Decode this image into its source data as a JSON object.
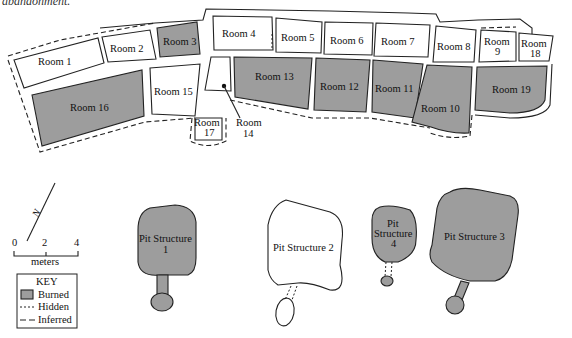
{
  "caption": "abandonment.",
  "colors": {
    "burned_fill": "#9d9d9d",
    "unburned_fill": "#ffffff",
    "line": "#222222"
  },
  "rooms": [
    {
      "id": "room-1",
      "label": "Room 1",
      "burned": false
    },
    {
      "id": "room-2",
      "label": "Room 2",
      "burned": false
    },
    {
      "id": "room-3",
      "label": "Room 3",
      "burned": true
    },
    {
      "id": "room-4",
      "label": "Room 4",
      "burned": false
    },
    {
      "id": "room-5",
      "label": "Room 5",
      "burned": false
    },
    {
      "id": "room-6",
      "label": "Room 6",
      "burned": false
    },
    {
      "id": "room-7",
      "label": "Room 7",
      "burned": false
    },
    {
      "id": "room-8",
      "label": "Room 8",
      "burned": false
    },
    {
      "id": "room-9",
      "label": "Room",
      "label2": "9",
      "burned": false
    },
    {
      "id": "room-18",
      "label": "Room",
      "label2": "18",
      "burned": false
    },
    {
      "id": "room-16",
      "label": "Room 16",
      "burned": true
    },
    {
      "id": "room-15",
      "label": "Room 15",
      "burned": false
    },
    {
      "id": "room-17",
      "label": "Room",
      "label2": "17",
      "burned": false
    },
    {
      "id": "room-14",
      "label": "Room",
      "label2": "14",
      "burned": false
    },
    {
      "id": "room-13",
      "label": "Room 13",
      "burned": true
    },
    {
      "id": "room-12",
      "label": "Room 12",
      "burned": true
    },
    {
      "id": "room-11",
      "label": "Room 11",
      "burned": true
    },
    {
      "id": "room-10",
      "label": "Room 10",
      "burned": true
    },
    {
      "id": "room-19",
      "label": "Room 19",
      "burned": true
    }
  ],
  "pit_structures": [
    {
      "id": "pit-1",
      "label": "Pit Structure",
      "label2": "1",
      "burned": true
    },
    {
      "id": "pit-2",
      "label": "Pit Structure 2",
      "burned": false
    },
    {
      "id": "pit-4",
      "label": "Pit",
      "label2": "Structure",
      "label3": "4",
      "burned": true
    },
    {
      "id": "pit-3",
      "label": "Pit Structure 3",
      "burned": true
    }
  ],
  "north_arrow": {
    "label": "N"
  },
  "scale": {
    "ticks": [
      "0",
      "2",
      "4"
    ],
    "unit": "meters"
  },
  "key": {
    "title": "KEY",
    "items": [
      {
        "symbol": "swatch",
        "label": "Burned"
      },
      {
        "symbol": "- - -",
        "label": "Hidden"
      },
      {
        "symbol": "— —",
        "label": "Inferred"
      }
    ]
  }
}
